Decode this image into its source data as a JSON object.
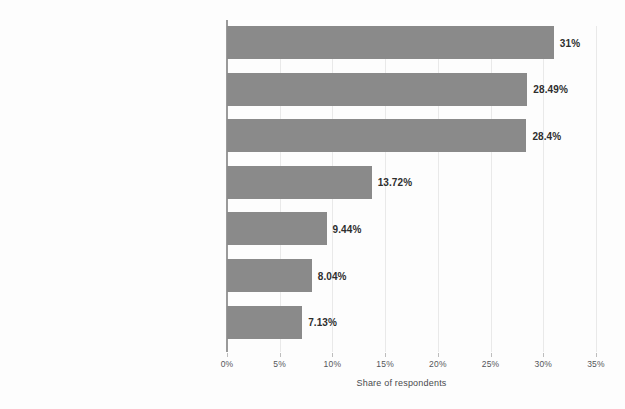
{
  "chart_data": {
    "type": "bar",
    "orientation": "horizontal",
    "title": "",
    "subtitle": "",
    "xlabel": "Share of respondents",
    "ylabel": "",
    "xlim": [
      0,
      35
    ],
    "grid": true,
    "legend": null,
    "categories": [
      "Basic requirement to transact",
      "Privacy",
      "Security",
      "Convenience",
      "Trust in instrument",
      "Aware of grievance redressal mechanism",
      "Trust in payee"
    ],
    "values": [
      31,
      28.49,
      28.4,
      13.72,
      9.44,
      8.04,
      7.13
    ],
    "value_labels": [
      "31%",
      "28.49%",
      "28.4%",
      "13.72%",
      "9.44%",
      "8.04%",
      "7.13%"
    ],
    "x_ticks": [
      0,
      5,
      10,
      15,
      20,
      25,
      30,
      35
    ],
    "x_tick_labels": [
      "0%",
      "5%",
      "10%",
      "15%",
      "20%",
      "25%",
      "30%",
      "35%"
    ],
    "colors": {
      "bar_fill": "#8a8a8a",
      "background": "#fdfdfd",
      "gridline": "#e9e9e9",
      "axis_line": "#9a9a9a",
      "label_text": "#3f3f3f",
      "value_text": "#2e2e2e",
      "tick_text": "#55565a"
    }
  }
}
